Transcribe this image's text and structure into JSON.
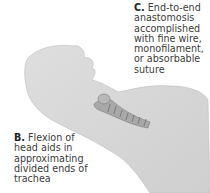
{
  "figure": {
    "colors": {
      "skin": "#d9d9d9",
      "skin_shadow": "#c4c4c4",
      "trachea": "#9a9a9a",
      "background": "#ffffff",
      "text": "#3c3c3c"
    }
  },
  "labels": {
    "c": {
      "letter": "C.",
      "lines": [
        "End-to-end",
        "anastomosis",
        "accomplished",
        "with fine wire,",
        "monofilament,",
        "or absorbable",
        "suture"
      ]
    },
    "b": {
      "letter": "B.",
      "lines": [
        "Flexion of",
        "head aids in",
        "approximating",
        "divided ends of",
        "trachea"
      ]
    }
  }
}
